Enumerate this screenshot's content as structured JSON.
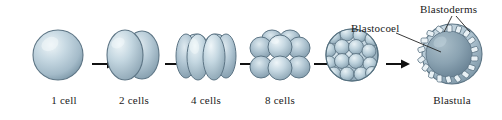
{
  "figure": {
    "background": "#ffffff"
  },
  "colors": {
    "cell_light": "#e8f0f4",
    "cell_mid": "#b9ccd8",
    "cell_dark": "#8fa7b5",
    "cell_outline": "#5d7585",
    "blastocoel_fill": "#7f98a8",
    "blastocoel_fill_light": "#9fb4c0",
    "text": "#1a1a1a",
    "arrow": "#111111",
    "leader": "#222222"
  },
  "stages": [
    {
      "id": "one-cell",
      "caption": "1 cell",
      "cell_count": 1
    },
    {
      "id": "two-cell",
      "caption": "2 cells",
      "cell_count": 2
    },
    {
      "id": "four-cell",
      "caption": "4 cells",
      "cell_count": 4
    },
    {
      "id": "eight-cell",
      "caption": "8 cells",
      "cell_count": 8
    },
    {
      "id": "morula",
      "caption": "",
      "cell_count": 32
    },
    {
      "id": "blastula",
      "caption": "Blastula",
      "cell_count": 64
    }
  ],
  "annotations": {
    "blastocoel": "Blastocoel",
    "blastoderms": "Blastoderms"
  },
  "icons": {
    "arrow": "arrow-right-icon"
  },
  "arrow_count": 5
}
